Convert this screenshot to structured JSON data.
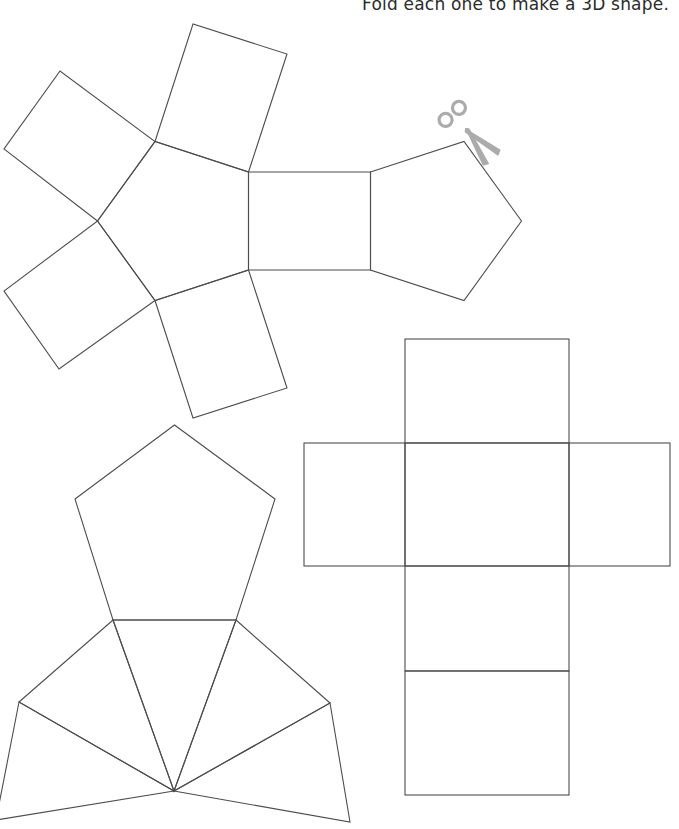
{
  "header": {
    "instruction": "Fold each one to make a 3D shape."
  },
  "colors": {
    "background": "#ffffff",
    "line": "#4d4d4d",
    "text": "#2b2b2b",
    "scissors": "#ababab"
  },
  "canvas": {
    "width": 679,
    "height": 829
  },
  "scissors": {
    "x": 465,
    "y": 128,
    "rotation": 48
  },
  "nets": [
    {
      "id": "pentagonal-prism-net",
      "label": "pentagonal prism net",
      "shapes": [
        {
          "name": "center-pentagon",
          "points": [
            [
              248.5,
              172
            ],
            [
              248.5,
              270
            ],
            [
              155,
              300.5
            ],
            [
              97.5,
              221
            ],
            [
              155,
              141.5
            ]
          ]
        },
        {
          "name": "right-square",
          "points": [
            [
              248.5,
              172
            ],
            [
              370.5,
              172
            ],
            [
              370.5,
              270
            ],
            [
              248.5,
              270
            ]
          ]
        },
        {
          "name": "right-pentagon",
          "points": [
            [
              370.5,
              172
            ],
            [
              464,
              141.5
            ],
            [
              521.5,
              221
            ],
            [
              464,
              300.5
            ],
            [
              370.5,
              270
            ]
          ]
        },
        {
          "name": "top-right-square",
          "points": [
            [
              155,
              141.5
            ],
            [
              193,
              24
            ],
            [
              287,
              54
            ],
            [
              248.5,
              172
            ]
          ]
        },
        {
          "name": "top-left-square",
          "points": [
            [
              97.5,
              221
            ],
            [
              4,
              149
            ],
            [
              60,
              71
            ],
            [
              155,
              141.5
            ]
          ]
        },
        {
          "name": "bottom-left-square",
          "points": [
            [
              155,
              300.5
            ],
            [
              59,
              369
            ],
            [
              4,
              291
            ],
            [
              97.5,
              221
            ]
          ]
        },
        {
          "name": "bottom-square",
          "points": [
            [
              248.5,
              270
            ],
            [
              287,
              388
            ],
            [
              193,
              418
            ],
            [
              155,
              300.5
            ]
          ]
        }
      ]
    },
    {
      "id": "pentagonal-pyramid-net",
      "label": "pentagonal pyramid net",
      "shapes": [
        {
          "name": "base-pentagon",
          "points": [
            [
              174.5,
              425
            ],
            [
              275,
              499
            ],
            [
              236,
              620
            ],
            [
              113,
              620
            ],
            [
              75,
              499
            ]
          ]
        },
        {
          "name": "triangle-center",
          "points": [
            [
              113,
              620
            ],
            [
              236,
              620
            ],
            [
              174,
              791
            ]
          ]
        },
        {
          "name": "triangle-left",
          "points": [
            [
              19,
              702
            ],
            [
              113,
              620
            ],
            [
              174,
              791
            ]
          ]
        },
        {
          "name": "triangle-far-left",
          "points": [
            [
              -4,
              820
            ],
            [
              19,
              702
            ],
            [
              174,
              791
            ]
          ]
        },
        {
          "name": "triangle-right",
          "points": [
            [
              236,
              620
            ],
            [
              330,
              703
            ],
            [
              174,
              791
            ]
          ]
        },
        {
          "name": "triangle-far-right",
          "points": [
            [
              330,
              703
            ],
            [
              350,
              822
            ],
            [
              174,
              791
            ]
          ]
        }
      ]
    },
    {
      "id": "cuboid-net",
      "label": "cuboid net",
      "shapes": [
        {
          "name": "top-face",
          "rect": [
            405,
            339,
            164,
            104
          ]
        },
        {
          "name": "left-face",
          "rect": [
            304,
            443,
            101,
            123
          ]
        },
        {
          "name": "middle-face",
          "rect": [
            405,
            443,
            164,
            123
          ]
        },
        {
          "name": "right-face",
          "rect": [
            569,
            443,
            101,
            123
          ]
        },
        {
          "name": "lower-face",
          "rect": [
            405,
            566,
            164,
            105
          ]
        },
        {
          "name": "bottom-face",
          "rect": [
            405,
            671,
            164,
            124
          ]
        }
      ]
    }
  ]
}
